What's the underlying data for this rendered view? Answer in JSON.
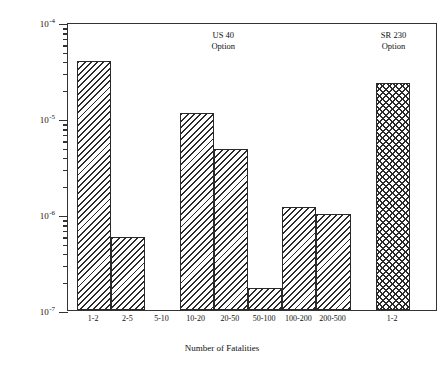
{
  "chart_data": {
    "type": "bar",
    "title": "",
    "xlabel": "Number of Fatalities",
    "ylabel": "Fatality Frequency (per 180 tons delivered)",
    "yscale": "log",
    "ylim": [
      1e-07,
      0.0001
    ],
    "grid": false,
    "legend": "none",
    "y_major_ticks": [
      {
        "label_base": "10",
        "label_exp": "-4",
        "value": 0.0001
      },
      {
        "label_base": "10",
        "label_exp": "-5",
        "value": 1e-05
      },
      {
        "label_base": "10",
        "label_exp": "-6",
        "value": 1e-06
      },
      {
        "label_base": "10",
        "label_exp": "-7",
        "value": 1e-07
      }
    ],
    "categories": [
      "1-2",
      "2-5",
      "5-10",
      "10-20",
      "20-50",
      "50-100",
      "100-200",
      "200-500",
      "1-2"
    ],
    "values": [
      3.9e-05,
      5.8e-07,
      0,
      1.12e-05,
      4.7e-06,
      1.7e-07,
      1.18e-06,
      1e-06,
      2.3e-05
    ],
    "bar_patterns": [
      "diagonal",
      "diagonal",
      "none",
      "diagonal",
      "diagonal",
      "diagonal",
      "diagonal",
      "diagonal",
      "crosshatch"
    ],
    "annotations": [
      {
        "text_line1": "US 40",
        "text_line2": "Option",
        "group": "us-40"
      },
      {
        "text_line1": "SR 230",
        "text_line2": "Option",
        "group": "sr-230"
      }
    ],
    "colors": {
      "bar_hatch": "#2b2b2b",
      "axis": "#333333",
      "background": "#ffffff"
    }
  }
}
